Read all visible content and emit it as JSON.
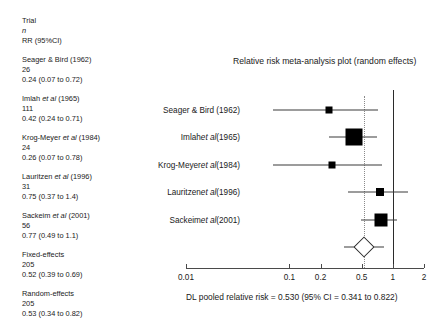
{
  "legend": {
    "header": {
      "trial": "Trial",
      "n": "n",
      "rr": "RR (95%CI)"
    },
    "entries": [
      {
        "trial": "Seager & Bird (1962)",
        "n": "26",
        "rr": "0.24 (0.07 to 0.72)"
      },
      {
        "trial": "Imlah et al (1965)",
        "trial_pre": "Imlah ",
        "trial_ital": "et al",
        "trial_post": " (1965)",
        "n": "111",
        "rr": "0.42 (0.24 to 0.71)"
      },
      {
        "trial": "Krog-Meyer et al (1984)",
        "trial_pre": "Krog-Meyer ",
        "trial_ital": "et al",
        "trial_post": " (1984)",
        "n": "24",
        "rr": "0.26 (0.07 to 0.78)"
      },
      {
        "trial": "Lauritzen et al (1996)",
        "trial_pre": "Lauritzen ",
        "trial_ital": "et al",
        "trial_post": " (1996)",
        "n": "31",
        "rr": "0.75 (0.37 to 1.4)"
      },
      {
        "trial": "Sackeim et al (2001)",
        "trial_pre": "Sackeim ",
        "trial_ital": "et al",
        "trial_post": " (2001)",
        "n": "56",
        "rr": "0.77 (0.49 to 1.1)"
      },
      {
        "trial": "Fixed-effects",
        "n": "205",
        "rr": "0.52 (0.39 to 0.69)"
      },
      {
        "trial": "Random-effects",
        "n": "205",
        "rr": "0.53 (0.34 to 0.82)"
      }
    ]
  },
  "plot": {
    "title": "Relative risk meta-analysis plot (random effects)",
    "caption": "DL pooled relative risk = 0.530  (95% CI = 0.341 to 0.822)",
    "null_value": "1",
    "pooled_value": "0.530"
  },
  "chart_data": {
    "type": "forest",
    "title": "Relative risk meta-analysis plot (random effects)",
    "xlabel": "",
    "ylabel": "",
    "xscale": "log",
    "xlim": [
      0.01,
      2
    ],
    "xticks": [
      0.01,
      0.1,
      0.2,
      0.5,
      1,
      2
    ],
    "xticklabels": [
      "0.01",
      "0.1",
      "0.2",
      "0.5",
      "1",
      "2"
    ],
    "grid": false,
    "legend": "none",
    "null_line": 1,
    "pooled_line": 0.53,
    "effect_measure": "Relative risk",
    "model": "random effects (DerSimonian-Laird)",
    "studies": [
      {
        "label": "Seager & Bird (1962)",
        "n": 26,
        "rr": 0.24,
        "ci_low": 0.07,
        "ci_high": 0.72,
        "weight_px": 7
      },
      {
        "label": "Imlah et al (1965)",
        "n": 111,
        "rr": 0.42,
        "ci_low": 0.24,
        "ci_high": 0.71,
        "weight_px": 17
      },
      {
        "label": "Krog-Meyer et al (1984)",
        "n": 24,
        "rr": 0.26,
        "ci_low": 0.07,
        "ci_high": 0.78,
        "weight_px": 7
      },
      {
        "label": "Lauritzen et al (1996)",
        "n": 31,
        "rr": 0.75,
        "ci_low": 0.37,
        "ci_high": 1.4,
        "weight_px": 8
      },
      {
        "label": "Sackeim et al (2001)",
        "n": 56,
        "rr": 0.77,
        "ci_low": 0.49,
        "ci_high": 1.1,
        "weight_px": 13
      }
    ],
    "pooled": [
      {
        "label": "Fixed-effects",
        "n": 205,
        "rr": 0.52,
        "ci_low": 0.39,
        "ci_high": 0.69
      },
      {
        "label": "Random-effects",
        "n": 205,
        "rr": 0.53,
        "ci_low": 0.34,
        "ci_high": 0.82
      }
    ],
    "summary_diamond": {
      "rr": 0.53,
      "ci_low": 0.34,
      "ci_high": 0.82
    },
    "caption": "DL pooled relative risk = 0.530  (95% CI = 0.341 to 0.822)"
  }
}
